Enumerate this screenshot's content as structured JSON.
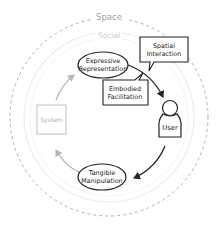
{
  "diagram": {
    "rings": {
      "outer_label": "Space",
      "inner_label": "Social"
    },
    "nodes": {
      "expressive": {
        "line1": "Expressive",
        "line2": "Representation"
      },
      "tangible": {
        "line1": "Tangible",
        "line2": "Manipulation"
      },
      "system": {
        "label": "System"
      },
      "user": {
        "label": "User"
      }
    },
    "callouts": {
      "spatial": {
        "line1": "Spatial",
        "line2": "Interaction"
      },
      "embodied": {
        "line1": "Embodied",
        "line2": "Facilitation"
      }
    },
    "colors": {
      "dark": "#222222",
      "gray": "#aaaaaa",
      "ring_outer": "#b0b0b0",
      "ring_inner": "#e6e6e6"
    }
  }
}
